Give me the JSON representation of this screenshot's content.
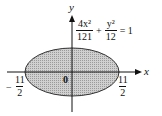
{
  "diagram": {
    "type": "ellipse-plot",
    "axes": {
      "x_label": "x",
      "y_label": "y",
      "origin_label": "0"
    },
    "equation": {
      "term1": {
        "numerator": "4x²",
        "denominator": "121"
      },
      "plus": "+",
      "term2": {
        "numerator": "y²",
        "denominator": "12"
      },
      "equals": "= 1"
    },
    "intercepts": {
      "left": {
        "sign": "−",
        "numerator": "11",
        "denominator": "2"
      },
      "right": {
        "numerator": "11",
        "denominator": "2"
      }
    },
    "ellipse": {
      "fill": "#c8c8c8",
      "stroke": "#333333",
      "semi_major_label": "11/2",
      "semi_minor_value": "√12"
    }
  }
}
